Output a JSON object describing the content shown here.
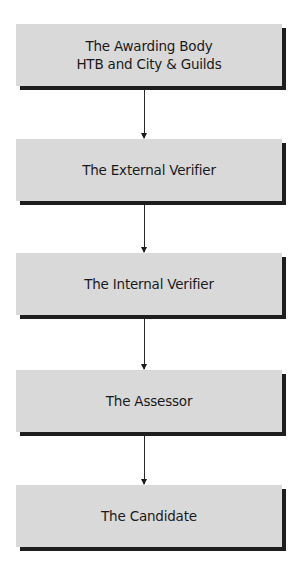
{
  "diagram": {
    "type": "flowchart",
    "direction": "top-to-bottom",
    "colors": {
      "box_fill": "#d9d9d9",
      "box_shadow": "#1e1e1e",
      "text": "#1a1a1a",
      "arrow": "#2a2a2a",
      "background": "#ffffff"
    },
    "nodes": [
      {
        "id": "awarding-body",
        "label": "The Awarding Body\nHTB and City & Guilds"
      },
      {
        "id": "external-verifier",
        "label": "The External Verifier"
      },
      {
        "id": "internal-verifier",
        "label": "The Internal Verifier"
      },
      {
        "id": "assessor",
        "label": "The Assessor"
      },
      {
        "id": "candidate",
        "label": "The Candidate"
      }
    ],
    "edges": [
      {
        "from": "awarding-body",
        "to": "external-verifier"
      },
      {
        "from": "external-verifier",
        "to": "internal-verifier"
      },
      {
        "from": "internal-verifier",
        "to": "assessor"
      },
      {
        "from": "assessor",
        "to": "candidate"
      }
    ]
  }
}
